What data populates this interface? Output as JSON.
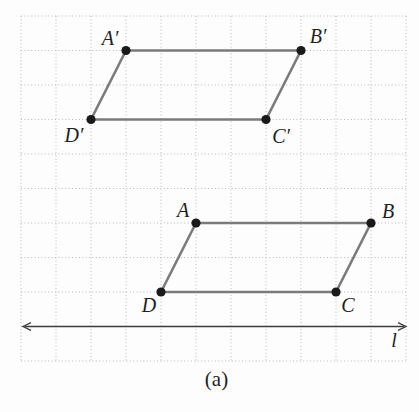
{
  "figure": {
    "caption": "(a)",
    "canvas": {
      "width": 419,
      "height": 366
    },
    "grid": {
      "x0": 21,
      "y0": 16,
      "cols": 11,
      "rows": 10,
      "cell_w": 35,
      "cell_h": 34.5
    },
    "shapes": [
      {
        "id": "image-parallelogram",
        "name": "A'B'C'D'",
        "vertices": [
          {
            "id": "A-prime",
            "label": "A′",
            "x": 126,
            "y": 50.5,
            "label_x": 110,
            "label_y": 45
          },
          {
            "id": "B-prime",
            "label": "B′",
            "x": 301,
            "y": 50.5,
            "label_x": 318,
            "label_y": 43
          },
          {
            "id": "C-prime",
            "label": "C′",
            "x": 266,
            "y": 119.5,
            "label_x": 281,
            "label_y": 143
          },
          {
            "id": "D-prime",
            "label": "D′",
            "x": 91,
            "y": 119.5,
            "label_x": 74,
            "label_y": 142
          }
        ]
      },
      {
        "id": "preimage-parallelogram",
        "name": "ABCD",
        "vertices": [
          {
            "id": "A",
            "label": "A",
            "x": 196,
            "y": 223,
            "label_x": 183,
            "label_y": 217
          },
          {
            "id": "B",
            "label": "B",
            "x": 371,
            "y": 223,
            "label_x": 388,
            "label_y": 218
          },
          {
            "id": "C",
            "label": "C",
            "x": 336,
            "y": 292,
            "label_x": 348,
            "label_y": 312
          },
          {
            "id": "D",
            "label": "D",
            "x": 161,
            "y": 292,
            "label_x": 149,
            "label_y": 312
          }
        ]
      }
    ],
    "mirror_line": {
      "label": "l",
      "x1": 23,
      "x2": 406,
      "y": 326.5,
      "label_x": 394,
      "label_y": 347
    }
  },
  "style": {
    "dot_radius": 4.6,
    "colors": {
      "background": "#fdfdfd",
      "grid": "#b9b9b9",
      "edge": "#7b7b7b",
      "dot": "#1a1a1a",
      "line": "#3c3c3c",
      "text": "#1f1f1f"
    }
  }
}
